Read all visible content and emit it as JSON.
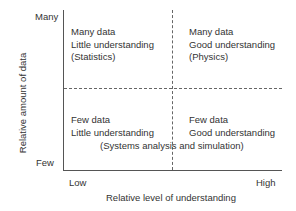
{
  "axes": {
    "y_label": "Relative amount of data",
    "y_high": "Many",
    "y_low": "Few",
    "x_label": "Relative level of understanding",
    "x_low": "Low",
    "x_high": "High"
  },
  "quadrants": {
    "top_left": {
      "line1": "Many data",
      "line2": "Little understanding",
      "line3": "(Statistics)"
    },
    "top_right": {
      "line1": "Many data",
      "line2": "Good understanding",
      "line3": "(Physics)"
    },
    "bottom_left": {
      "line1": "Few data",
      "line2": "Little understanding"
    },
    "bottom_right": {
      "line1": "Few data",
      "line2": "Good understanding"
    },
    "bottom_span": "(Systems analysis and simulation)"
  }
}
